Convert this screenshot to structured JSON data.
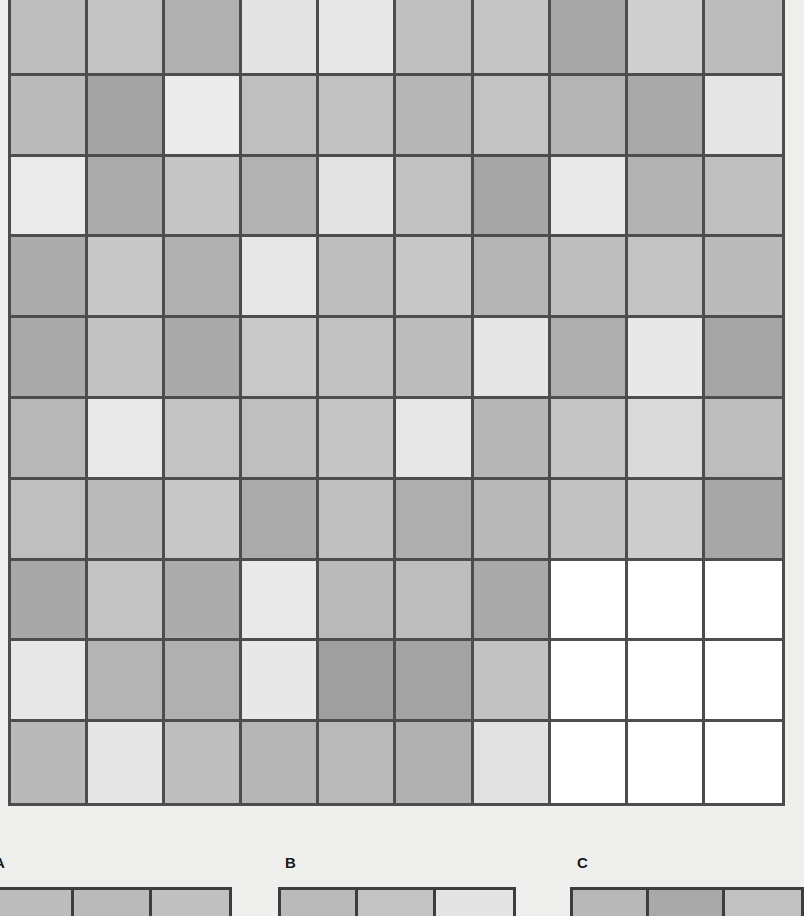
{
  "background_color": "#efefed",
  "border_color": "#4d4d4d",
  "main_grid": {
    "name": "grayscale-patch-grid",
    "rows": 10,
    "cols": 10,
    "cells": [
      [
        "#bdbdbd",
        "#c4c4c4",
        "#b0b0b0",
        "#e4e4e4",
        "#e8e8e8",
        "#c0c0c0",
        "#c6c6c6",
        "#a8a8a8",
        "#cfcfcf",
        "#bcbcbc"
      ],
      [
        "#bababa",
        "#a4a4a4",
        "#ebebeb",
        "#bfbfbf",
        "#c2c2c2",
        "#b6b6b6",
        "#c3c3c3",
        "#b4b4b4",
        "#a9a9a9",
        "#e6e6e6"
      ],
      [
        "#eaeaea",
        "#ababab",
        "#c5c5c5",
        "#b2b2b2",
        "#e3e3e3",
        "#c1c1c1",
        "#a6a6a6",
        "#e9e9e9",
        "#b3b3b3",
        "#c0c0c0"
      ],
      [
        "#ababab",
        "#c8c8c8",
        "#b1b1b1",
        "#e7e7e7",
        "#bdbdbd",
        "#c7c7c7",
        "#b5b5b5",
        "#bebebe",
        "#c4c4c4",
        "#bbbbbb"
      ],
      [
        "#a9a9a9",
        "#c2c2c2",
        "#aaaaaa",
        "#c9c9c9",
        "#c1c1c1",
        "#bcbcbc",
        "#e5e5e5",
        "#aeaeae",
        "#e8e8e8",
        "#a5a5a5"
      ],
      [
        "#b8b8b8",
        "#e9e9e9",
        "#c3c3c3",
        "#bfbfbf",
        "#c6c6c6",
        "#e7e7e7",
        "#b7b7b7",
        "#c5c5c5",
        "#dadada",
        "#bdbdbd"
      ],
      [
        "#bfbfbf",
        "#bbbbbb",
        "#c7c7c7",
        "#ababab",
        "#c0c0c0",
        "#aeaeae",
        "#b9b9b9",
        "#c2c2c2",
        "#cdcdcd",
        "#a7a7a7"
      ],
      [
        "#a8a8a8",
        "#c4c4c4",
        "#acacac",
        "#e9e9e9",
        "#bababa",
        "#bdbdbd",
        "#a9a9a9",
        "#ffffff",
        "#ffffff",
        "#ffffff"
      ],
      [
        "#e7e7e7",
        "#b5b5b5",
        "#b0b0b0",
        "#e8e8e8",
        "#9f9f9f",
        "#a3a3a3",
        "#c2c2c2",
        "#ffffff",
        "#ffffff",
        "#ffffff"
      ],
      [
        "#b9b9b9",
        "#e6e6e6",
        "#bebebe",
        "#b6b6b6",
        "#bababa",
        "#b1b1b1",
        "#e2e2e2",
        "#ffffff",
        "#ffffff",
        "#ffffff"
      ]
    ]
  },
  "panels": [
    {
      "id": "panel-a",
      "label": "A",
      "cells": [
        "#bcbcbc",
        "#bababa",
        "#c0c0c0"
      ]
    },
    {
      "id": "panel-b",
      "label": "B",
      "cells": [
        "#bababa",
        "#c3c3c3",
        "#e4e4e4"
      ]
    },
    {
      "id": "panel-c",
      "label": "C",
      "cells": [
        "#b8b8b8",
        "#a9a9a9",
        "#c1c1c1"
      ]
    }
  ],
  "chart_data": {
    "type": "heatmap",
    "title": "",
    "xlabel": "",
    "ylabel": "",
    "grid": true,
    "legend_position": "none",
    "colorscale": "grayscale",
    "rows": 10,
    "cols": 10,
    "note": "Grayscale luminance values 0-255 per cell; 255 = white block at rows 8-10 x cols 8-10",
    "values": [
      [
        189,
        196,
        176,
        228,
        232,
        192,
        198,
        168,
        207,
        188
      ],
      [
        186,
        164,
        235,
        191,
        194,
        182,
        195,
        180,
        169,
        230
      ],
      [
        234,
        171,
        197,
        178,
        227,
        193,
        166,
        233,
        179,
        192
      ],
      [
        171,
        200,
        177,
        231,
        189,
        199,
        181,
        190,
        196,
        187
      ],
      [
        169,
        194,
        170,
        201,
        193,
        188,
        229,
        174,
        232,
        165
      ],
      [
        184,
        233,
        195,
        191,
        198,
        231,
        183,
        197,
        218,
        189
      ],
      [
        191,
        187,
        199,
        171,
        192,
        174,
        185,
        194,
        205,
        167
      ],
      [
        168,
        196,
        172,
        233,
        186,
        189,
        169,
        255,
        255,
        255
      ],
      [
        231,
        181,
        176,
        232,
        159,
        163,
        194,
        255,
        255,
        255
      ],
      [
        185,
        230,
        190,
        182,
        186,
        177,
        226,
        255,
        255,
        255
      ]
    ],
    "panels": [
      {
        "label": "A",
        "values": [
          188,
          186,
          192
        ]
      },
      {
        "label": "B",
        "values": [
          186,
          195,
          228
        ]
      },
      {
        "label": "C",
        "values": [
          184,
          169,
          193
        ]
      }
    ]
  }
}
